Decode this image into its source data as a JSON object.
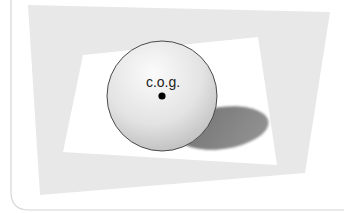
{
  "diagram": {
    "cog_label": "c.o.g.",
    "colors": {
      "background": "#ffffff",
      "frame_line": "#d6d6d6",
      "backdrop_panel": "#e8e8e8",
      "surface": "#ffffff",
      "sphere_light": "#fbfbfb",
      "sphere_mid": "#e3e3e3",
      "sphere_dark": "#bdbdbd",
      "sphere_outline": "#4a4a4a",
      "shadow": "#8f8f8f",
      "cog_dot": "#000000",
      "label": "#222222"
    }
  }
}
